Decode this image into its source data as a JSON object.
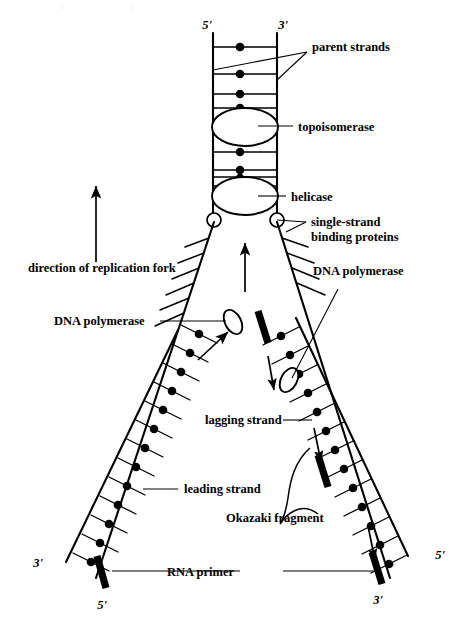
{
  "figure": {
    "background_color": "#ffffff",
    "ink_color": "#000000"
  },
  "labels": {
    "parent_strands": "parent strands",
    "topoisomerase": "topoisomerase",
    "helicase": "helicase",
    "ssb_line1": "single-strand",
    "ssb_line2": "binding proteins",
    "direction_of_fork": "direction of replication fork",
    "dna_polymerase_left": "DNA polymerase",
    "dna_polymerase_right": "DNA polymerase",
    "leading_strand": "leading strand",
    "lagging_strand": "lagging strand",
    "okazaki_fragment": "Okazaki fragment",
    "rna_primer": "RNA primer"
  },
  "termini": {
    "top_left": "5'",
    "top_right": "3'",
    "bottom_left_outer": "3'",
    "bottom_left_inner": "5'",
    "bottom_right_inner": "3'",
    "bottom_right_outer": "5'"
  },
  "structures": {
    "parent_duplex": {
      "name": "parent duplex",
      "left_backbone_x": 213,
      "right_backbone_x": 277,
      "top_y": 33,
      "bottom_y": 218,
      "rung_count": 8
    },
    "topoisomerase": {
      "cx": 245,
      "cy": 127,
      "rx": 33,
      "ry": 19
    },
    "helicase": {
      "cx": 245,
      "cy": 196,
      "rx": 33,
      "ry": 19
    },
    "ssb_left": {
      "cx": 214,
      "cy": 220,
      "r": 7
    },
    "ssb_right": {
      "cx": 277,
      "cy": 220,
      "r": 7
    },
    "polymerase_left": {
      "cx": 233,
      "cy": 322,
      "rx": 8,
      "ry": 13,
      "rotation": -28
    },
    "polymerase_right": {
      "cx": 289,
      "cy": 380,
      "rx": 8,
      "ry": 13,
      "rotation": 28
    },
    "left_arm": {
      "name": "leading strand arm",
      "top": [
        214,
        222
      ],
      "bottom": [
        95,
        572
      ],
      "synthesized_from_y": 325
    },
    "right_arm": {
      "name": "lagging strand arm",
      "top": [
        277,
        222
      ],
      "bottom": [
        385,
        572
      ]
    },
    "primers": [
      {
        "name": "left-arm-rna-primer",
        "x1": 96,
        "y1": 556,
        "x2": 104,
        "y2": 585
      },
      {
        "name": "lagging-primer-top",
        "x1": 258,
        "y1": 311,
        "x2": 268,
        "y2": 342
      },
      {
        "name": "lagging-primer-middle",
        "x1": 318,
        "y1": 455,
        "x2": 328,
        "y2": 486
      },
      {
        "name": "lagging-primer-bottom",
        "x1": 372,
        "y1": 552,
        "x2": 382,
        "y2": 583
      }
    ],
    "arrows": [
      {
        "name": "fork-direction-arrow",
        "x1": 96,
        "y1": 262,
        "x2": 96,
        "y2": 188
      },
      {
        "name": "fork-center-arrow",
        "x1": 245,
        "y1": 290,
        "x2": 245,
        "y2": 243
      },
      {
        "name": "leading-synthesis-arrow",
        "x1": 200,
        "y1": 358,
        "x2": 231,
        "y2": 330
      },
      {
        "name": "lagging-synthesis-arrow-upper",
        "x1": 269,
        "y1": 358,
        "x2": 275,
        "y2": 392
      },
      {
        "name": "lagging-synthesis-arrow-middle",
        "x1": 315,
        "y1": 430,
        "x2": 322,
        "y2": 462
      },
      {
        "name": "lagging-synthesis-arrow-lower",
        "x1": 369,
        "y1": 528,
        "x2": 376,
        "y2": 560
      }
    ],
    "okazaki_brace": {
      "from_primer": "lagging-primer-middle",
      "to_primer": "lagging-primer-bottom"
    }
  }
}
